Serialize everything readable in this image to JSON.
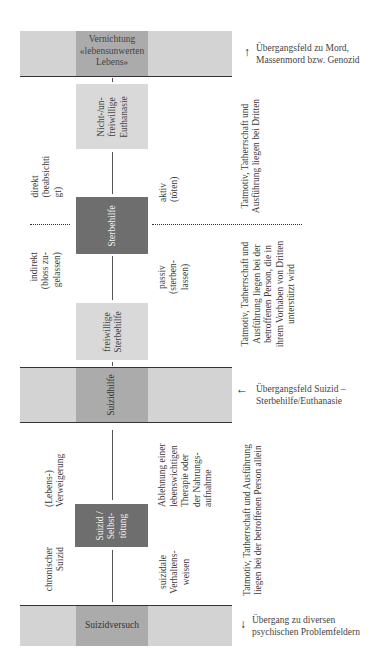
{
  "bands": {
    "top": {
      "label": "Vernichtung «lebensunwerten Lebens»",
      "lines": [
        "Vernichtung",
        "«lebensunwerten",
        "Lebens»"
      ]
    },
    "middle": {
      "label": "Suizidhilfe"
    },
    "bottom": {
      "label": "Suizidversuch"
    }
  },
  "boxes": {
    "nicht_freiwillige": {
      "lines": [
        "Nicht-/un-",
        "freiwillige",
        "Euthanasie"
      ]
    },
    "sterbehilfe": {
      "label": "Sterbehilfe"
    },
    "freiwillige": {
      "lines": [
        "freiwillige",
        "Sterbehilfe"
      ]
    },
    "suizid": {
      "lines": [
        "Suizid /",
        "Selbst-",
        "tötung"
      ]
    }
  },
  "labels": {
    "direkt": [
      "direkt",
      "(beabsichti",
      "gt)"
    ],
    "aktiv": [
      "aktiv",
      "(töten)"
    ],
    "indirekt": [
      "indirekt",
      "(bloss zu-",
      "gelassen)"
    ],
    "passiv": [
      "passiv",
      "(sterben-",
      "lassen)"
    ],
    "lebens_verweigerung": [
      "(Lebens-)",
      "Verweigerung"
    ],
    "ablehnung": [
      "Ablehnung einer",
      "lebenswichtigen",
      "Therapie oder",
      "der Nahrungs-",
      "aufnahme"
    ],
    "chronischer_suizid": [
      "chronischer",
      "Suizid"
    ],
    "suizidale_verhaltensweisen": [
      "suizidale",
      "Verhaltens-",
      "weisen"
    ]
  },
  "responsibility": {
    "third_party": [
      "Tatmotiv, Tatherrschaft und",
      "Ausführung liegen bei Dritten"
    ],
    "assisted": [
      "Tatmotiv, Tatherrschaft und",
      "Ausführung liegen bei der",
      "betroffenen Person, die in",
      "ihrem Vorhaben von Dritten",
      "unterstützt wird"
    ],
    "self": [
      "Tatmotiv, Tatherrschaft und Ausführung",
      "liegen bei der betroffenen Person allein"
    ]
  },
  "transitions": {
    "top": {
      "arrow": "↑",
      "lines": [
        "Übergangsfeld zu Mord,",
        "Massenmord bzw. Genozid"
      ]
    },
    "middle": {
      "arrow": "←",
      "lines": [
        "Übergangsfeld Suizid –",
        "Sterbehilfe/Euthanasie"
      ]
    },
    "bottom": {
      "arrow": "↓",
      "lines": [
        "Übergang zu diversen",
        "psychischen Problemfeldern"
      ]
    }
  },
  "colors": {
    "band_light": "#d3d3d3",
    "band_dark": "#ababab",
    "box_light": "#d9d9d9",
    "box_dark": "#6e6e6e"
  }
}
